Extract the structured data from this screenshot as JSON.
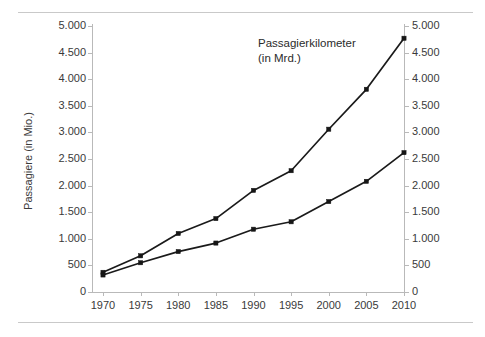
{
  "chart_data": {
    "type": "line",
    "title": "",
    "subtitle": "",
    "xlabel": "",
    "ylabel": "Passagiere (in Mio.)",
    "ylabel_right": "",
    "annotation": "Passagierkilometer",
    "annotation_unit": "(in Mrd.)",
    "grid": false,
    "legend_position": "none",
    "x": [
      1970,
      1975,
      1980,
      1985,
      1990,
      1995,
      2000,
      2005,
      2010
    ],
    "categories": [
      "1970",
      "1975",
      "1980",
      "1985",
      "1990",
      "1995",
      "2000",
      "2005",
      "2010"
    ],
    "xlim": [
      1970,
      2010
    ],
    "ylim": [
      0,
      5000
    ],
    "ylim_right": [
      0,
      5000
    ],
    "ytick_labels": [
      "0",
      "500",
      "1.000",
      "1.500",
      "2.000",
      "2.500",
      "3.000",
      "3.500",
      "4.000",
      "4.500",
      "5.000"
    ],
    "ytick_values": [
      0,
      500,
      1000,
      1500,
      2000,
      2500,
      3000,
      3500,
      4000,
      4500,
      5000
    ],
    "ytick_labels_right": [
      "0",
      "500",
      "1.000",
      "1.500",
      "2.000",
      "2.500",
      "3.000",
      "3.500",
      "4.000",
      "4.500",
      "5.000"
    ],
    "series": [
      {
        "name": "Passagierkilometer (in Mrd.)",
        "axis": "right",
        "color": "#1a1a1a",
        "values": [
          370,
          680,
          1100,
          1380,
          1910,
          2280,
          3060,
          3810,
          4770
        ]
      },
      {
        "name": "Passagiere (in Mio.)",
        "axis": "left",
        "color": "#1a1a1a",
        "values": [
          320,
          550,
          760,
          920,
          1180,
          1320,
          1700,
          2080,
          2620
        ]
      }
    ]
  },
  "axis": {
    "left_title": "Passagiere (in Mio.)"
  },
  "annotation": {
    "line1": "Passagierkilometer",
    "line2": "(in Mrd.)"
  }
}
